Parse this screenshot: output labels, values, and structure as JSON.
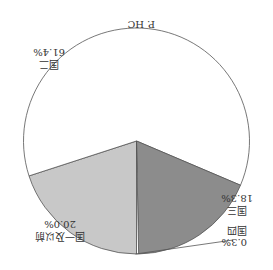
{
  "chart_data": {
    "type": "pie",
    "title": "P. HC",
    "orientation_note": "rendered rotated 180 degrees",
    "categories": [
      "国一及以前",
      "国二",
      "国三",
      "国四"
    ],
    "values": [
      20.0,
      61.4,
      18.3,
      0.3
    ],
    "value_labels": [
      "20.0%",
      "61.4%",
      "18.3%",
      "0.3%"
    ],
    "colors": [
      "#c8c8c8",
      "#ffffff",
      "#8c8c8c",
      "#ffffff"
    ],
    "legend": "none (direct labels)"
  },
  "labels": {
    "title": "P. HC",
    "s0_name": "国一及以前",
    "s0_val": "20.0%",
    "s1_name": "国二",
    "s1_val": "61.4%",
    "s2_name": "国三",
    "s2_val": "18.3%",
    "s3_name": "国四",
    "s3_val": "0.3%"
  }
}
